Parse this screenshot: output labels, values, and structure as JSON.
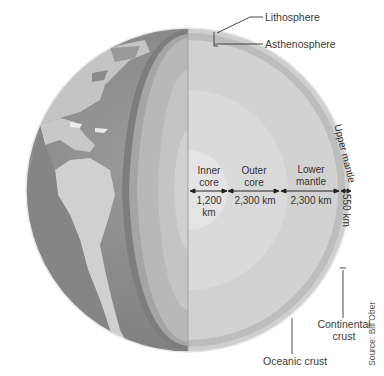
{
  "diagram": {
    "callouts": {
      "lithosphere": "Lithosphere",
      "asthenosphere": "Asthenosphere",
      "continental_crust_line1": "Continental",
      "continental_crust_line2": "crust",
      "oceanic_crust": "Oceanic crust"
    },
    "layers": [
      {
        "name_line1": "Inner",
        "name_line2": "core",
        "thickness_line1": "1,200",
        "thickness_line2": "km"
      },
      {
        "name_line1": "Outer",
        "name_line2": "core",
        "thickness": "2,300 km"
      },
      {
        "name_line1": "Lower",
        "name_line2": "mantle",
        "thickness": "2,300 km"
      },
      {
        "name": "Upper mantle",
        "thickness": "550 km"
      }
    ],
    "source": "Source: Bill Ober",
    "colors": {
      "ocean": "#8e8e8e",
      "land": "#c9c9c9",
      "crust_band": "#6f6f6f",
      "mantle": "#b4b4b4",
      "cut_face": "#d6d6d6",
      "core": "#e2e2e2"
    }
  }
}
